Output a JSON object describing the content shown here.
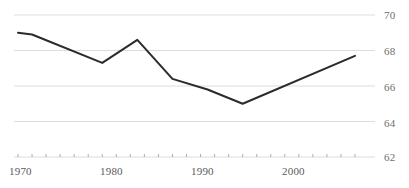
{
  "chart_data": {
    "type": "line",
    "title": "",
    "subtitle": "",
    "xlabel": "",
    "ylabel": "",
    "xlim": [
      1970,
      2018
    ],
    "ylim": [
      62,
      70
    ],
    "grid": true,
    "legend": false,
    "legend_position": "none",
    "y_ticks": [
      70,
      68,
      66,
      64,
      62
    ],
    "y_tick_labels": [
      "70",
      "68",
      "66",
      "64",
      "62"
    ],
    "x_ticks": [
      1970,
      1980,
      1990,
      2000
    ],
    "x_tick_labels": [
      "1970",
      "1980",
      "1990",
      "2000"
    ],
    "x_minor_tick_interval": 2,
    "line_color": "#2b2b2b",
    "grid_color": "#d9d9d9",
    "series": [
      {
        "name": "series-1",
        "x": [
          1970,
          1972,
          1982,
          1987,
          1992,
          1997,
          2002,
          2018
        ],
        "values": [
          69.0,
          68.9,
          67.3,
          68.6,
          66.4,
          65.8,
          65.0,
          67.7
        ]
      }
    ]
  }
}
